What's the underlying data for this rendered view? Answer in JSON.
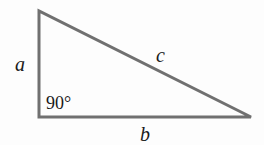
{
  "diagram": {
    "type": "right-triangle",
    "stroke_color": "#707070",
    "background": "#fdfdfd",
    "vertices": {
      "top": [
        39,
        11
      ],
      "right_angle": [
        39,
        117
      ],
      "right": [
        251,
        117
      ]
    },
    "labels": {
      "side_a": "a",
      "side_b": "b",
      "side_c": "c",
      "angle": "90°"
    }
  }
}
